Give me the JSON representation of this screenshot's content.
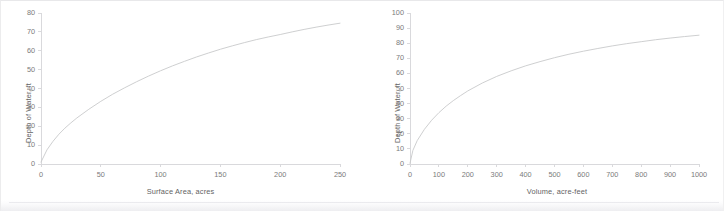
{
  "figure": {
    "background": "#ffffff",
    "line_color": "#c8c9cb",
    "axis_color": "#d9d9dc",
    "tick_text_color": "#7b7b7b",
    "title_text_color": "#636363",
    "panel_count": 2
  },
  "chart_data": [
    {
      "id": "surface-area-chart",
      "type": "line",
      "title": "",
      "xlabel": "Surface Area, acres",
      "ylabel": "Depth of Water, ft",
      "xlim": [
        0,
        250
      ],
      "ylim": [
        0,
        80
      ],
      "xticks": [
        "0",
        "50",
        "100",
        "150",
        "200",
        "250"
      ],
      "xtick_values": [
        0,
        50,
        100,
        150,
        200,
        250
      ],
      "yticks": [
        "0",
        "10",
        "20",
        "30",
        "40",
        "50",
        "60",
        "70",
        "80"
      ],
      "ytick_values": [
        0,
        10,
        20,
        30,
        40,
        50,
        60,
        70,
        80
      ],
      "grid": false,
      "legend": "none",
      "series": [
        {
          "name": "Depth vs Surface Area",
          "color": "#c8c9cb",
          "x": [
            0,
            5,
            10,
            15,
            20,
            25,
            30,
            40,
            50,
            60,
            70,
            80,
            90,
            100,
            110,
            120,
            130,
            140,
            150,
            160,
            170,
            180,
            190,
            200,
            210,
            220,
            230,
            240,
            250
          ],
          "y": [
            1.0,
            7.5,
            12.0,
            15.8,
            19.0,
            21.8,
            24.4,
            29.0,
            33.2,
            37.0,
            40.4,
            43.6,
            46.6,
            49.4,
            52.0,
            54.4,
            56.7,
            58.8,
            60.8,
            62.6,
            64.3,
            65.9,
            67.3,
            68.6,
            70.0,
            71.3,
            72.5,
            73.6,
            74.6
          ]
        }
      ]
    },
    {
      "id": "volume-chart",
      "type": "line",
      "title": "",
      "xlabel": "Volume, acre-feet",
      "ylabel": "Depth of Water, ft",
      "xlim": [
        0,
        1000
      ],
      "ylim": [
        0,
        100
      ],
      "xticks": [
        "0",
        "100",
        "200",
        "300",
        "400",
        "500",
        "600",
        "700",
        "800",
        "900",
        "1000"
      ],
      "xtick_values": [
        0,
        100,
        200,
        300,
        400,
        500,
        600,
        700,
        800,
        900,
        1000
      ],
      "yticks": [
        "0",
        "10",
        "20",
        "30",
        "40",
        "50",
        "60",
        "70",
        "80",
        "90",
        "100"
      ],
      "ytick_values": [
        0,
        10,
        20,
        30,
        40,
        50,
        60,
        70,
        80,
        90,
        100
      ],
      "grid": false,
      "legend": "none",
      "series": [
        {
          "name": "Depth vs Volume",
          "color": "#c8c9cb",
          "x": [
            0,
            10,
            25,
            50,
            75,
            100,
            125,
            150,
            175,
            200,
            250,
            300,
            350,
            400,
            450,
            500,
            550,
            600,
            650,
            700,
            750,
            800,
            850,
            900,
            950,
            1000
          ],
          "y": [
            0.5,
            9.0,
            15.5,
            23.0,
            29.0,
            34.0,
            38.3,
            42.0,
            45.3,
            48.4,
            53.6,
            58.0,
            61.7,
            65.0,
            67.8,
            70.4,
            72.7,
            74.7,
            76.5,
            78.2,
            79.7,
            81.0,
            82.3,
            83.4,
            84.4,
            85.3
          ]
        }
      ]
    }
  ]
}
